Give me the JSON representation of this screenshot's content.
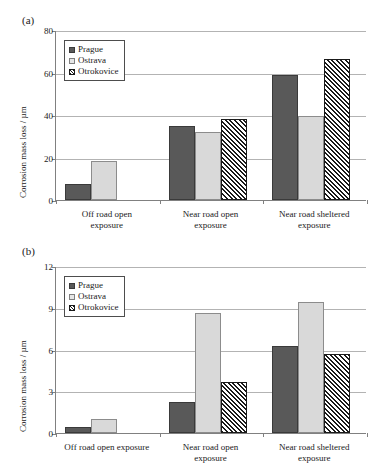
{
  "figure": {
    "panels": [
      {
        "panel_label": "(a)",
        "legend": [
          "Prague",
          "Ostrava",
          "Otrokovice"
        ]
      },
      {
        "panel_label": "(b)",
        "legend": [
          "Prague",
          "Ostrava",
          "Otrokovice"
        ]
      }
    ]
  },
  "chart_data": [
    {
      "type": "bar",
      "title": "",
      "panel": "(a)",
      "categories": [
        "Off road open exposure",
        "Near road open exposure",
        "Near road sheltered exposure"
      ],
      "category_lines": [
        [
          "Off road open",
          "exposure"
        ],
        [
          "Near road open",
          "exposure"
        ],
        [
          "Near road sheltered",
          "exposure"
        ]
      ],
      "series": [
        {
          "name": "Prague",
          "values": [
            7.5,
            35.0,
            59.0
          ],
          "color": "#595959",
          "fill": "solid"
        },
        {
          "name": "Ostrava",
          "values": [
            18.5,
            32.0,
            39.5
          ],
          "color": "#d9d9d9",
          "fill": "solid"
        },
        {
          "name": "Otrokovice",
          "values": [
            null,
            38.0,
            66.5
          ],
          "color": "#ffffff",
          "fill": "diagonal-hatch"
        }
      ],
      "xlabel": "",
      "ylabel": "Corrosion mass loss / µm",
      "ylim": [
        0,
        80
      ],
      "yticks": [
        0,
        20,
        40,
        60,
        80
      ],
      "grid": true,
      "legend_position": "upper-left"
    },
    {
      "type": "bar",
      "title": "",
      "panel": "(b)",
      "categories": [
        "Off road open exposure",
        "Near road open exposure",
        "Near road sheltered exposure"
      ],
      "category_lines": [
        [
          "Off road open exposure"
        ],
        [
          "Near road open",
          "exposure"
        ],
        [
          "Near road sheltered",
          "exposure"
        ]
      ],
      "series": [
        {
          "name": "Prague",
          "values": [
            0.4,
            2.2,
            6.25
          ],
          "color": "#595959",
          "fill": "solid"
        },
        {
          "name": "Ostrava",
          "values": [
            1.0,
            8.6,
            9.4
          ],
          "color": "#d9d9d9",
          "fill": "solid"
        },
        {
          "name": "Otrokovice",
          "values": [
            null,
            3.7,
            5.7
          ],
          "color": "#ffffff",
          "fill": "diagonal-hatch"
        }
      ],
      "xlabel": "",
      "ylabel": "Corrosion mass loss / µm",
      "ylim": [
        0,
        12
      ],
      "yticks": [
        0,
        3,
        6,
        9,
        12
      ],
      "grid": true,
      "legend_position": "upper-left"
    }
  ]
}
